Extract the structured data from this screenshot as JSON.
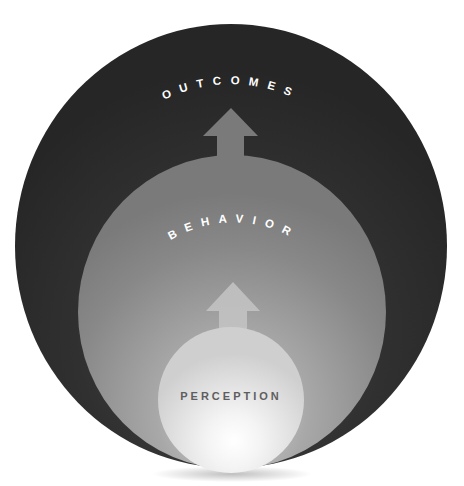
{
  "diagram": {
    "layers": [
      {
        "id": "outcomes",
        "label": "OUTCOMES",
        "color": "#2b2b2b"
      },
      {
        "id": "behavior",
        "label": "BEHAVIOR",
        "color": "#8e8e8e"
      },
      {
        "id": "perception",
        "label": "PERCEPTION",
        "color": "#dcdcdc"
      }
    ],
    "arrows": [
      {
        "from": "behavior",
        "to": "outcomes",
        "direction": "up"
      },
      {
        "from": "perception",
        "to": "behavior",
        "direction": "up"
      }
    ]
  }
}
